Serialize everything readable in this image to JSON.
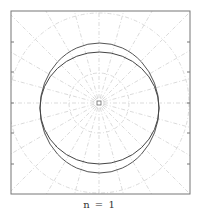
{
  "caption": "n = 1",
  "chart_data": {
    "type": "line",
    "title": "",
    "caption": "n = 1",
    "coordinate_system": "polar",
    "frame": {
      "x0": 11,
      "y0": 11,
      "x1": 190,
      "y1": 194
    },
    "center": {
      "x": 99,
      "y": 103
    },
    "grid": {
      "on": true,
      "style": "dash-dot",
      "color": "#cfcfcf",
      "circle_radii_px": [
        5,
        30,
        90
      ],
      "spoke_count": 24
    },
    "y_ticks_px": [
      42,
      72,
      103,
      133,
      164
    ],
    "series": [
      {
        "name": "outer curve",
        "shape": "ellipse",
        "cx": 99.5,
        "cy": 108,
        "rx": 59.5,
        "ry": 65,
        "color": "#555555"
      },
      {
        "name": "inner curve",
        "shape": "ellipse",
        "cx": 99.5,
        "cy": 108,
        "rx": 59.5,
        "ry": 56,
        "color": "#444444"
      }
    ]
  }
}
